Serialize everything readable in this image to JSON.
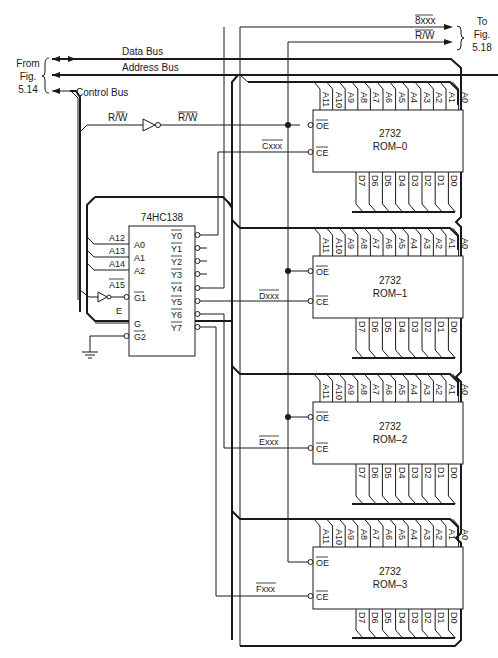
{
  "figure": {
    "from_label": [
      "From",
      "Fig.",
      "5.14"
    ],
    "to_label": [
      "To",
      "Fig.",
      "5.18"
    ]
  },
  "buses": {
    "data": "Data Bus",
    "address": "Address Bus",
    "control": "Control Bus"
  },
  "signals": {
    "rw_in": "R/W",
    "rw_out": "R/W",
    "out_8xxx": "8xxx",
    "out_rw": "R/W",
    "e": "E"
  },
  "decoder": {
    "part": "74HC138",
    "inputs": [
      {
        "net": "A12",
        "pin": "A0"
      },
      {
        "net": "A13",
        "pin": "A1"
      },
      {
        "net": "A14",
        "pin": "A2"
      },
      {
        "net": "A15",
        "pin": "G1"
      },
      {
        "net": "E",
        "pin": "G"
      },
      {
        "net": "GND",
        "pin": "G2"
      }
    ],
    "outputs": [
      "Y0",
      "Y1",
      "Y2",
      "Y3",
      "Y4",
      "Y5",
      "Y6",
      "Y7"
    ]
  },
  "roms": [
    {
      "part": "2732",
      "name": "ROM–0",
      "select": "Cxxx"
    },
    {
      "part": "2732",
      "name": "ROM–1",
      "select": "Dxxx"
    },
    {
      "part": "2732",
      "name": "ROM–2",
      "select": "Exxx"
    },
    {
      "part": "2732",
      "name": "ROM–3",
      "select": "Fxxx"
    }
  ],
  "rom_pins": {
    "address": [
      "A11",
      "A10",
      "A9",
      "A8",
      "A7",
      "A6",
      "A5",
      "A4",
      "A3",
      "A2",
      "A1",
      "A0"
    ],
    "data": [
      "D7",
      "D6",
      "D5",
      "D4",
      "D3",
      "D2",
      "D1",
      "D0"
    ],
    "oe": "OE",
    "ce": "CE"
  }
}
